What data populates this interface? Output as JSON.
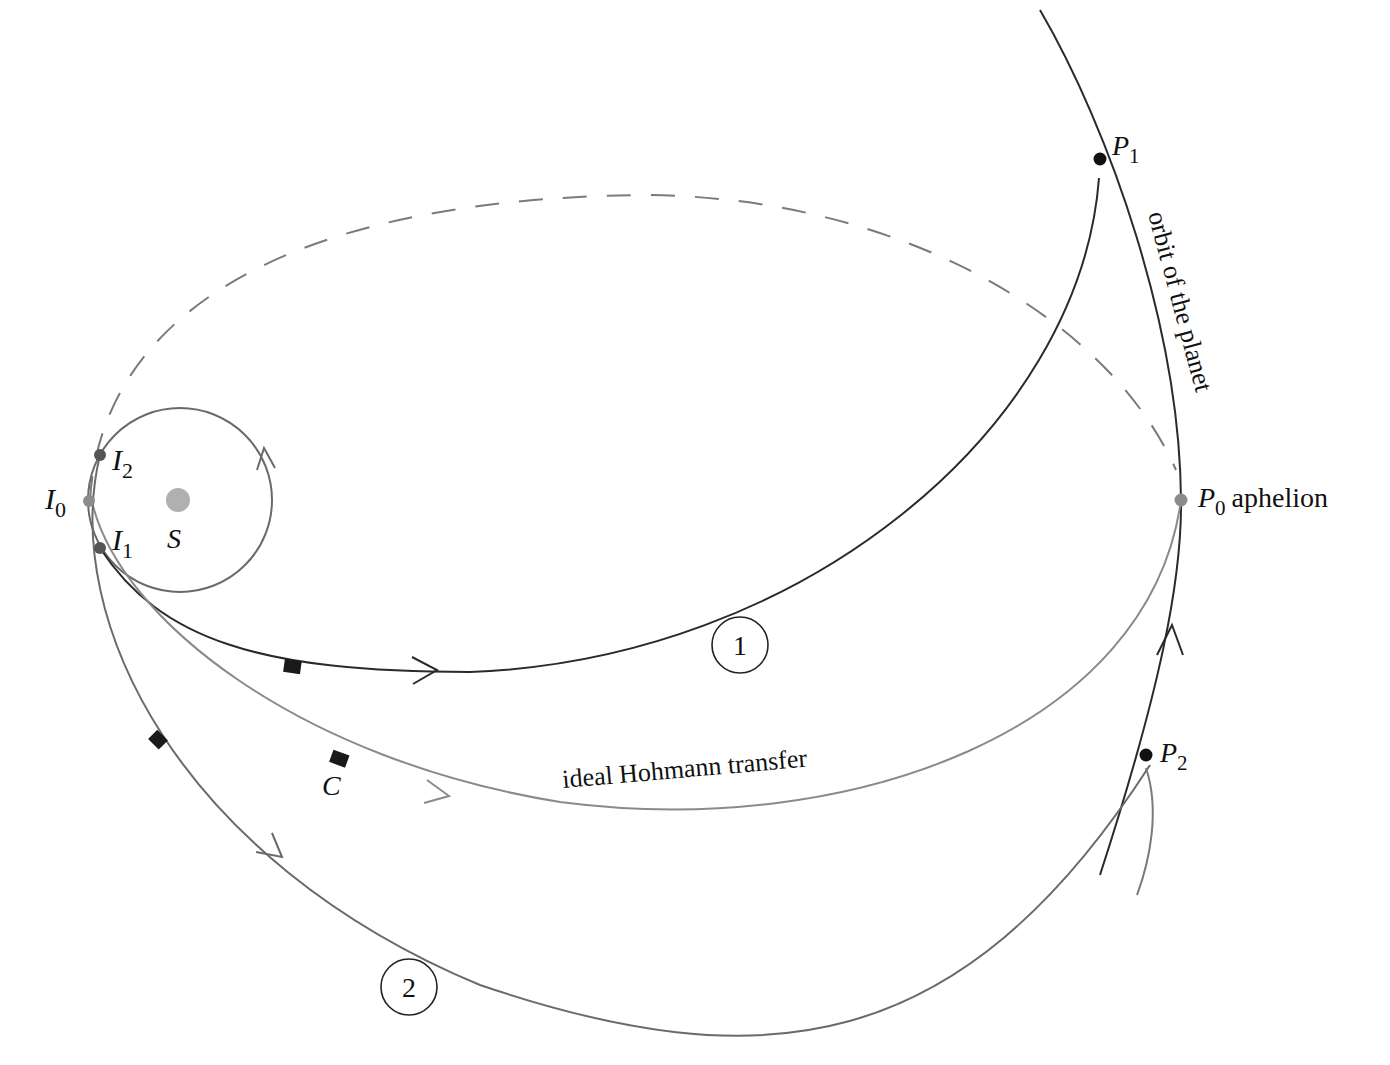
{
  "figure": {
    "labels": {
      "I0": {
        "main": "I",
        "sub": "0"
      },
      "I1": {
        "main": "I",
        "sub": "1"
      },
      "I2": {
        "main": "I",
        "sub": "2"
      },
      "S": "S",
      "C": "C",
      "P0": {
        "main": "P",
        "sub": "0",
        "suffix": "aphelion"
      },
      "P1": {
        "main": "P",
        "sub": "1"
      },
      "P2": {
        "main": "P",
        "sub": "2"
      },
      "orbit_label": "orbit of the planet",
      "hohmann_label": "ideal  Hohmann transfer",
      "trajectory_1": "1",
      "trajectory_2": "2"
    },
    "colors": {
      "dark_line": "#2a2a2a",
      "gray_line": "#7a7a7a",
      "sun": "#b0b0b0",
      "gray_point": "#8c8c8c",
      "dark_point": "#555555",
      "black_point": "#111111"
    }
  }
}
